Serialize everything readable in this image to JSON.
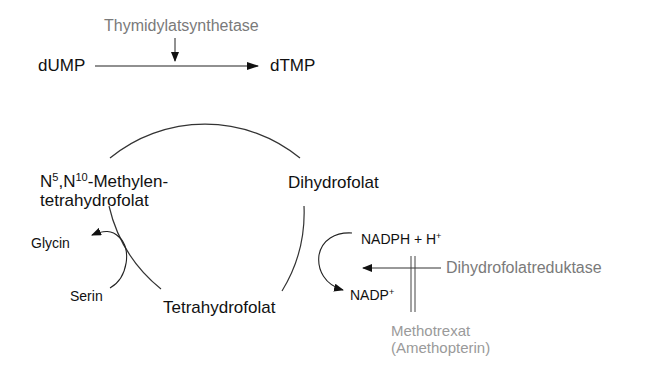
{
  "diagram": {
    "enzymes": {
      "top": "Thymidylatsynthetase",
      "right": "Dihydrofolatreduktase"
    },
    "substrates": {
      "dump": "dUMP",
      "dtmp": "dTMP"
    },
    "cycle_nodes": {
      "methylene_part1": "N",
      "methylene_sup1": "5",
      "methylene_part2": ",N",
      "methylene_sup2": "10",
      "methylene_part3": "-Methylen-",
      "methylene_line2": "tetrahydrofolat",
      "dihydrofolat": "Dihydrofolat",
      "tetrahydrofolat": "Tetrahydrofolat"
    },
    "side_reactions": {
      "glycin": "Glycin",
      "serin": "Serin",
      "nadph": "NADPH + H",
      "nadph_sup": "+",
      "nadp": "NADP",
      "nadp_sup": "+"
    },
    "inhibitor": {
      "line1": "Methotrexat",
      "line2": "(Amethopterin)"
    },
    "colors": {
      "main_text": "#111111",
      "enzyme_text": "#7a7a7a",
      "inhibitor_text": "#9a9a9a",
      "lines": "#222222"
    }
  }
}
